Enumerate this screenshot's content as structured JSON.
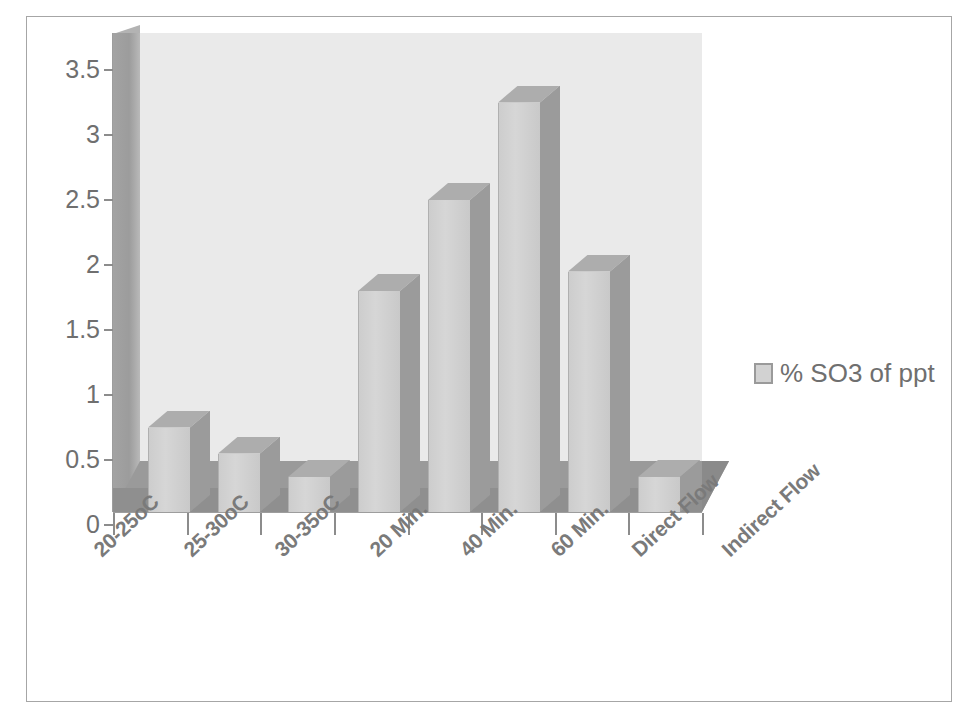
{
  "chart_data": {
    "type": "bar",
    "title": "",
    "subtitle": "",
    "xlabel": "",
    "ylabel": "",
    "categories": [
      "20-25oC",
      "25-30oC",
      "30-35oC",
      "20 Min.",
      "40 Min.",
      "60 Min.",
      "Direct Flow",
      "Indirect Flow"
    ],
    "series": [
      {
        "name": "% SO3 of ppt",
        "values": [
          0.65,
          0.45,
          0.27,
          1.7,
          2.4,
          3.15,
          1.85,
          0.27
        ]
      }
    ],
    "ylim": [
      0,
      3.5
    ],
    "ytick_labels": [
      "0",
      "0.5",
      "1",
      "1.5",
      "2",
      "2.5",
      "3",
      "3.5"
    ],
    "ytick_values": [
      0,
      0.5,
      1,
      1.5,
      2,
      2.5,
      3,
      3.5
    ],
    "grid": false,
    "legend_position": "right",
    "style": "3d-column",
    "colors": {
      "bar_front": "#d2d2d2",
      "bar_side": "#9b9b9b",
      "bar_top": "#adadad",
      "back_wall": "#eaeaea",
      "floor": "#9a9a9a",
      "axis": "#9d9d9d",
      "text": "#6f6f6f",
      "frame_border": "#a6a6a6"
    }
  },
  "legend": {
    "items": [
      {
        "label": "% SO3 of ppt",
        "swatch_color": "#d2d2d2"
      }
    ]
  }
}
